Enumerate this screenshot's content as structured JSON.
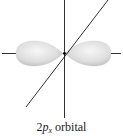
{
  "figure": {
    "orbital": "2p",
    "subscript": "x",
    "caption_rest": " orbital",
    "caption_prefix": "2",
    "caption_p": "p",
    "axes": [
      "x-axis",
      "y-axis",
      "z-axis"
    ],
    "lobes": [
      "left-lobe",
      "right-lobe"
    ],
    "colors": {
      "lobe_light": "#f4f4f4",
      "lobe_mid": "#d8d8d8",
      "lobe_dark": "#b5b5b5",
      "axis": "#1a1a1a",
      "nucleus": "#000000"
    }
  }
}
